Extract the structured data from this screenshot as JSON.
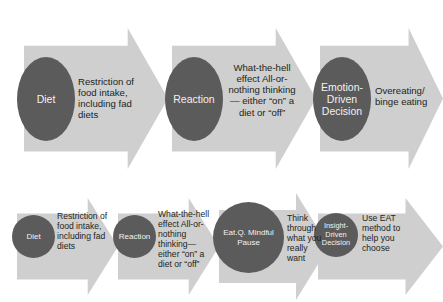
{
  "diagram": {
    "type": "two-row process flow of chevron arrows with labeled bubbles",
    "colors": {
      "arrow_fill": "#cfcfcf",
      "node_fill": "#5b5b5b",
      "node_text": "#f2f2f2",
      "caption_text": "#231f20",
      "background": "#ffffff"
    },
    "rows": [
      {
        "id": "reactive-cycle",
        "steps": [
          {
            "node": "Diet",
            "caption": "Restriction of food intake, including fad diets"
          },
          {
            "node": "Reaction",
            "caption": "What-the-hell effect All-or-nothing thinking— either “on” a diet or “off”"
          },
          {
            "node": "Emotion-Driven Decision",
            "caption": "Overeating/ binge eating"
          }
        ]
      },
      {
        "id": "mindful-cycle",
        "steps": [
          {
            "node": "Diet",
            "caption": "Restriction of food intake, including fad diets"
          },
          {
            "node": "Reaction",
            "caption": "What-the-hell effect All-or-nothing thinking— either “on” a diet or “off”"
          },
          {
            "node": "Eat.Q. Mindful Pause",
            "caption": "Think through what you really want"
          },
          {
            "node": "Insight-Driven Decision",
            "caption": "Use EAT method to help you choose"
          }
        ]
      }
    ]
  }
}
